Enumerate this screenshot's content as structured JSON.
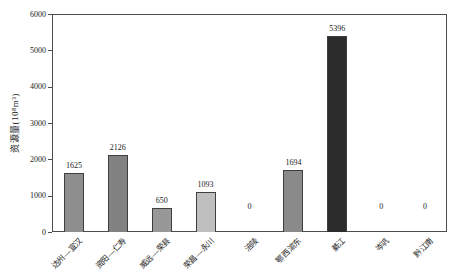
{
  "chart_data": {
    "type": "bar",
    "title": "",
    "xlabel": "",
    "ylabel": "资源量(10⁸m³)",
    "ylim": [
      0,
      6000
    ],
    "yticks": [
      0,
      1000,
      2000,
      3000,
      4000,
      5000,
      6000
    ],
    "grid": false,
    "legend": "none",
    "categories": [
      "达州—宣汉",
      "资阳—仁寿",
      "威远—荣县",
      "荣昌—永川",
      "涪陵",
      "鄂西渝东",
      "綦江",
      "岑巩",
      "黔江南"
    ],
    "values": [
      1625,
      2126,
      650,
      1093,
      0,
      1694,
      5396,
      0,
      0
    ],
    "value_labels": [
      "1625",
      "2126",
      "650",
      "1093",
      "0",
      "1694",
      "5396",
      "0",
      "0"
    ],
    "bar_colors": [
      "#8e8e8e",
      "#828282",
      "#989898",
      "#bfbfbf",
      "#9a9a9a",
      "#8a8a8a",
      "#2c2c2c",
      "#9a9a9a",
      "#9a9a9a"
    ],
    "axis_color": "#4d4d4d",
    "text_color": "#222222",
    "background_color": "#ffffff"
  }
}
